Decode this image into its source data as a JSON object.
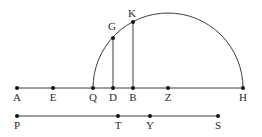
{
  "figure": {
    "width": 262,
    "height": 137,
    "background": "#ffffff",
    "line_color": "#3d3d3d",
    "dot_color": "#141414",
    "label_color": "#2b2b2b",
    "line_width": 1,
    "dot_radius": 2,
    "font_size": 11,
    "semicircle": {
      "cx": 168,
      "cy": 88,
      "r": 75
    },
    "segments": [
      {
        "name": "main-line-AH",
        "x1": 17,
        "y1": 88,
        "x2": 243,
        "y2": 88
      },
      {
        "name": "segment-DG",
        "x1": 113,
        "y1": 88,
        "x2": 113,
        "y2": 38
      },
      {
        "name": "segment-BK",
        "x1": 133,
        "y1": 88,
        "x2": 133,
        "y2": 22
      },
      {
        "name": "lower-line-PS",
        "x1": 17,
        "y1": 116,
        "x2": 218,
        "y2": 116
      }
    ],
    "points": [
      {
        "label": "A",
        "x": 17,
        "y": 88,
        "label_dx": 0,
        "label_dy": 13
      },
      {
        "label": "E",
        "x": 53,
        "y": 88,
        "label_dx": 0,
        "label_dy": 13
      },
      {
        "label": "Q",
        "x": 93,
        "y": 88,
        "label_dx": 0,
        "label_dy": 13
      },
      {
        "label": "D",
        "x": 113,
        "y": 88,
        "label_dx": 0,
        "label_dy": 13
      },
      {
        "label": "B",
        "x": 133,
        "y": 88,
        "label_dx": 0,
        "label_dy": 13
      },
      {
        "label": "Z",
        "x": 168,
        "y": 88,
        "label_dx": 0,
        "label_dy": 13
      },
      {
        "label": "H",
        "x": 243,
        "y": 88,
        "label_dx": 0,
        "label_dy": 13
      },
      {
        "label": "G",
        "x": 113,
        "y": 38,
        "label_dx": -1,
        "label_dy": -8
      },
      {
        "label": "K",
        "x": 133,
        "y": 22,
        "label_dx": -1,
        "label_dy": -5
      },
      {
        "label": "P",
        "x": 17,
        "y": 116,
        "label_dx": 0,
        "label_dy": 13
      },
      {
        "label": "T",
        "x": 118,
        "y": 116,
        "label_dx": 0,
        "label_dy": 13
      },
      {
        "label": "Y",
        "x": 150,
        "y": 116,
        "label_dx": 0,
        "label_dy": 13
      },
      {
        "label": "S",
        "x": 218,
        "y": 116,
        "label_dx": 0,
        "label_dy": 13
      }
    ]
  }
}
